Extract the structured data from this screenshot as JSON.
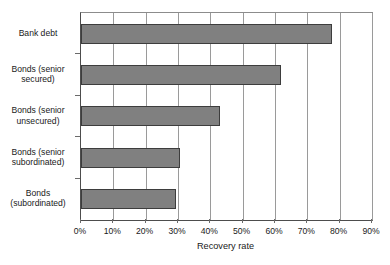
{
  "chart_data": {
    "type": "bar",
    "orientation": "horizontal",
    "title": "",
    "xlabel": "Recovery rate",
    "ylabel": "",
    "categories": [
      "Bank debt",
      "Bonds (senior\nsecured)",
      "Bonds (senior\nunsecured)",
      "Bonds (senior\nsubordinated)",
      "Bonds\n(subordinated)"
    ],
    "values": [
      77.5,
      62.0,
      43.0,
      30.5,
      29.5
    ],
    "xlim": [
      0,
      90
    ],
    "xticks": [
      0,
      10,
      20,
      30,
      40,
      50,
      60,
      70,
      80,
      90
    ],
    "xtick_labels": [
      "0%",
      "10%",
      "20%",
      "30%",
      "40%",
      "50%",
      "60%",
      "70%",
      "80%",
      "90%"
    ],
    "grid": "vertical",
    "legend": "none",
    "bar_color": "#808080",
    "bar_edge_color": "#3d3d3d",
    "background_color": "#ffffff"
  }
}
